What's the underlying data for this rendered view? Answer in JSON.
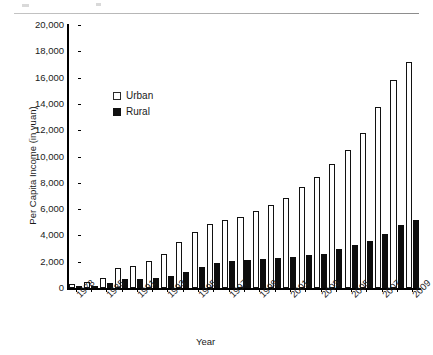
{
  "chart_data": {
    "type": "bar",
    "title": "",
    "xlabel": "Year",
    "ylabel": "Per Capita Income (in yuan)",
    "ylim": [
      0,
      20000
    ],
    "ytick_step": 2000,
    "ytick_labels": [
      "20,000",
      "18,000",
      "16,000",
      "14,000",
      "12,000",
      "10,000",
      "8,000",
      "6,000",
      "4,000",
      "2,000",
      "0"
    ],
    "ytick_values": [
      20000,
      18000,
      16000,
      14000,
      12000,
      10000,
      8000,
      6000,
      4000,
      2000,
      0
    ],
    "grid": false,
    "legend_position": "upper-left-inside",
    "categories": [
      "1978",
      "1980",
      "1985",
      "1990",
      "1991",
      "1992",
      "1993",
      "1994",
      "1995",
      "1996",
      "1997",
      "1998",
      "1999",
      "2000",
      "2001",
      "2002",
      "2003",
      "2004",
      "2005",
      "2006",
      "2007",
      "2008",
      "2009"
    ],
    "visible_tick_labels": [
      "1978",
      "1985",
      "1991",
      "1993",
      "1995",
      "1997",
      "1999",
      "2001",
      "2003",
      "2005",
      "2007",
      "2009"
    ],
    "series": [
      {
        "name": "Urban",
        "color": "#ffffff",
        "edge_color": "#121212",
        "values": [
          343,
          478,
          739,
          1510,
          1701,
          2027,
          2577,
          3496,
          4283,
          4839,
          5160,
          5425,
          5854,
          6280,
          6860,
          7703,
          8472,
          9422,
          10493,
          11760,
          13786,
          15781,
          17175
        ]
      },
      {
        "name": "Rural",
        "color": "#0d0d0d",
        "edge_color": "#0d0d0d",
        "values": [
          134,
          191,
          398,
          686,
          709,
          784,
          922,
          1221,
          1578,
          1926,
          2090,
          2162,
          2210,
          2253,
          2366,
          2476,
          2622,
          2936,
          3255,
          3587,
          4140,
          4761,
          5153
        ]
      }
    ]
  },
  "legend": {
    "items": [
      {
        "label": "Urban",
        "swatch": "white-square"
      },
      {
        "label": "Rural",
        "swatch": "black-square"
      }
    ]
  }
}
